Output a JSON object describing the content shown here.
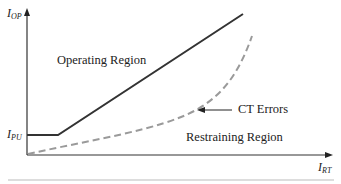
{
  "diagram": {
    "axes": {
      "y_label_main": "I",
      "y_label_sub": "OP",
      "x_label_main": "I",
      "x_label_sub": "RT",
      "pickup_label_main": "I",
      "pickup_label_sub": "PU"
    },
    "regions": {
      "operating": "Operating Region",
      "restraining": "Restraining Region"
    },
    "annotations": {
      "ct_errors": "CT Errors"
    },
    "colors": {
      "solid_line": "#333333",
      "dashed_curve": "#999999",
      "axis": "#333333",
      "bottom_rule": "#bbbbbb"
    }
  }
}
